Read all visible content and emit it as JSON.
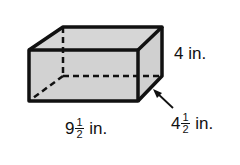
{
  "diagram": {
    "shape": "rectangular prism",
    "fill_color": "#d4d4d4",
    "stroke_color": "#111111",
    "dimensions": {
      "height": {
        "whole": "4",
        "unit": "in."
      },
      "length": {
        "whole": "9",
        "num": "1",
        "den": "2",
        "unit": "in."
      },
      "width": {
        "whole": "4",
        "num": "1",
        "den": "2",
        "unit": "in."
      }
    }
  }
}
